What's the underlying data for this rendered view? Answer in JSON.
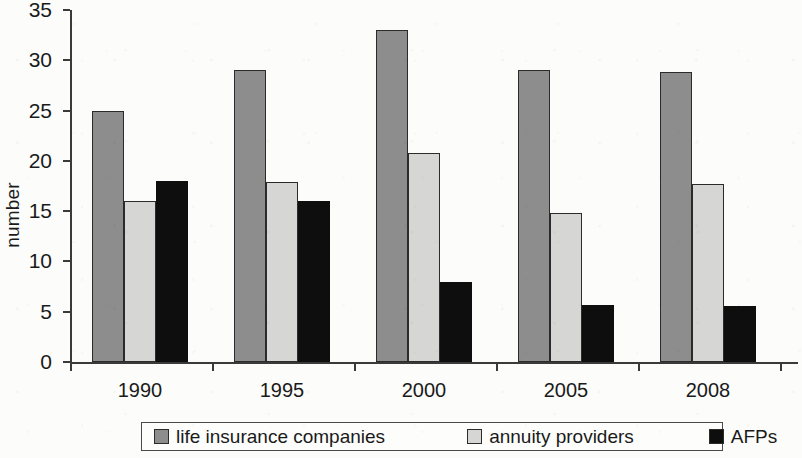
{
  "chart_data": {
    "type": "bar",
    "title": "",
    "subtitle": "",
    "xlabel": "",
    "ylabel": "number",
    "categories": [
      "1990",
      "1995",
      "2000",
      "2005",
      "2008"
    ],
    "series": [
      {
        "name": "life insurance companies",
        "color": "#8d8d8d",
        "values": [
          25,
          29,
          33,
          29,
          28.8
        ]
      },
      {
        "name": "annuity providers",
        "color": "#d6d6d4",
        "values": [
          16,
          17.9,
          20.8,
          14.8,
          17.7
        ]
      },
      {
        "name": "AFPs",
        "color": "#0e0e0e",
        "values": [
          18,
          16,
          8,
          5.7,
          5.6
        ]
      }
    ],
    "ylim": [
      0,
      35
    ],
    "yticks": [
      0,
      5,
      10,
      15,
      20,
      25,
      30,
      35
    ],
    "ytick_labels": [
      "0",
      "5",
      "10",
      "15",
      "20",
      "25",
      "30",
      "35"
    ],
    "grid": false,
    "legend_position": "bottom",
    "bar_group_gap": true
  },
  "legend": {
    "items": [
      {
        "label": "life insurance companies",
        "swatch": "series-0-swatch"
      },
      {
        "label": "annuity providers",
        "swatch": "series-1-swatch"
      },
      {
        "label": "AFPs",
        "swatch": "series-2-swatch"
      }
    ]
  }
}
